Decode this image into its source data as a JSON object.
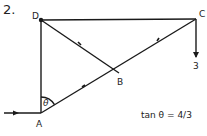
{
  "problem_number": "2.",
  "points": {
    "A": "A",
    "B": "B",
    "C": "C",
    "D": "D"
  },
  "angle_label": "θ",
  "load_label": "3",
  "equation": "tan θ = 4/3",
  "members": [
    "AD",
    "DC",
    "DB",
    "AB",
    "BC"
  ],
  "colors": {
    "stroke": "#1a1a1a",
    "background": "#ffffff"
  }
}
